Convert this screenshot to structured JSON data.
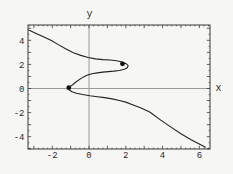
{
  "figure": {
    "background": "#f6f6f4",
    "frame_color": "#3a3a3a",
    "axis_line_color": "#9b9b9b",
    "curve_color": "#222222",
    "point_color": "#111111",
    "text_color": "#2b2b2b"
  },
  "chart_data": {
    "type": "line",
    "title": "",
    "xlabel": "x",
    "ylabel": "y",
    "xlim": [
      -3.32,
      6.58
    ],
    "ylim": [
      -5.02,
      5.27
    ],
    "grid": "axes-through-origin-only",
    "frame": true,
    "x_ticks": [
      {
        "value": -2,
        "label": "-2"
      },
      {
        "value": 0,
        "label": "0"
      },
      {
        "value": 2,
        "label": "2"
      },
      {
        "value": 4,
        "label": "4"
      },
      {
        "value": 6,
        "label": "6"
      }
    ],
    "y_ticks": [
      {
        "value": 4,
        "label": "4"
      },
      {
        "value": 2,
        "label": "2"
      },
      {
        "value": 0,
        "label": "0"
      },
      {
        "value": -2,
        "label": "-2"
      },
      {
        "value": -4,
        "label": "-4"
      }
    ],
    "minor_tick_step_x": 0.25,
    "minor_tick_step_y": 0.5,
    "series": [
      {
        "name": "implicit-curve",
        "points": [
          [
            -3.28,
            4.85
          ],
          [
            -2.85,
            4.55
          ],
          [
            -2.45,
            4.27
          ],
          [
            -2.05,
            3.98
          ],
          [
            -1.65,
            3.62
          ],
          [
            -1.25,
            3.28
          ],
          [
            -0.85,
            2.97
          ],
          [
            -0.45,
            2.75
          ],
          [
            -0.05,
            2.58
          ],
          [
            0.35,
            2.46
          ],
          [
            0.75,
            2.4
          ],
          [
            1.15,
            2.36
          ],
          [
            1.5,
            2.3
          ],
          [
            1.8,
            2.2
          ],
          [
            2.02,
            2.06
          ],
          [
            2.13,
            1.9
          ],
          [
            2.08,
            1.73
          ],
          [
            1.92,
            1.6
          ],
          [
            1.65,
            1.5
          ],
          [
            1.35,
            1.44
          ],
          [
            1.05,
            1.4
          ],
          [
            0.75,
            1.36
          ],
          [
            0.45,
            1.3
          ],
          [
            0.15,
            1.22
          ],
          [
            -0.15,
            1.08
          ],
          [
            -0.45,
            0.82
          ],
          [
            -0.75,
            0.5
          ],
          [
            -0.97,
            0.22
          ],
          [
            -1.1,
            0.05
          ],
          [
            -1.07,
            -0.13
          ],
          [
            -0.93,
            -0.27
          ],
          [
            -0.68,
            -0.39
          ],
          [
            -0.35,
            -0.5
          ],
          [
            0.05,
            -0.6
          ],
          [
            0.45,
            -0.68
          ],
          [
            0.85,
            -0.76
          ],
          [
            1.25,
            -0.86
          ],
          [
            1.65,
            -0.99
          ],
          [
            2.0,
            -1.13
          ],
          [
            2.4,
            -1.36
          ],
          [
            2.8,
            -1.6
          ],
          [
            3.3,
            -1.95
          ],
          [
            3.9,
            -2.62
          ],
          [
            4.5,
            -3.25
          ],
          [
            5.0,
            -3.75
          ],
          [
            5.55,
            -4.25
          ],
          [
            6.05,
            -4.65
          ],
          [
            6.33,
            -4.87
          ]
        ]
      }
    ],
    "marked_points": [
      {
        "x": -1.1,
        "y": 0.07
      },
      {
        "x": 1.82,
        "y": 2.05
      }
    ]
  }
}
